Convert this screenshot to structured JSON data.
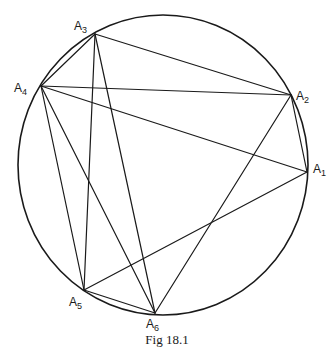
{
  "figure": {
    "caption": "Fig 18.1",
    "circle": {
      "cx": 163,
      "cy": 165,
      "rx": 145,
      "ry": 150
    },
    "stroke_color": "#1a1a1a"
  },
  "vertices": [
    {
      "id": "A1",
      "base": "A",
      "sub": "1",
      "x": 307,
      "y": 172,
      "label_x": 313,
      "label_y": 163
    },
    {
      "id": "A2",
      "base": "A",
      "sub": "2",
      "x": 291,
      "y": 95,
      "label_x": 296,
      "label_y": 90
    },
    {
      "id": "A3",
      "base": "A",
      "sub": "3",
      "x": 95,
      "y": 34,
      "label_x": 74,
      "label_y": 20
    },
    {
      "id": "A4",
      "base": "A",
      "sub": "4",
      "x": 41,
      "y": 86,
      "label_x": 14,
      "label_y": 82
    },
    {
      "id": "A5",
      "base": "A",
      "sub": "5",
      "x": 84,
      "y": 290,
      "label_x": 69,
      "label_y": 296
    },
    {
      "id": "A6",
      "base": "A",
      "sub": "6",
      "x": 155,
      "y": 313,
      "label_x": 146,
      "label_y": 318
    }
  ],
  "edges": [
    [
      "A3",
      "A2"
    ],
    [
      "A3",
      "A4"
    ],
    [
      "A3",
      "A5"
    ],
    [
      "A3",
      "A6"
    ],
    [
      "A4",
      "A2"
    ],
    [
      "A4",
      "A1"
    ],
    [
      "A4",
      "A5"
    ],
    [
      "A4",
      "A6"
    ],
    [
      "A2",
      "A1"
    ],
    [
      "A2",
      "A6"
    ],
    [
      "A1",
      "A5"
    ],
    [
      "A5",
      "A6"
    ]
  ]
}
